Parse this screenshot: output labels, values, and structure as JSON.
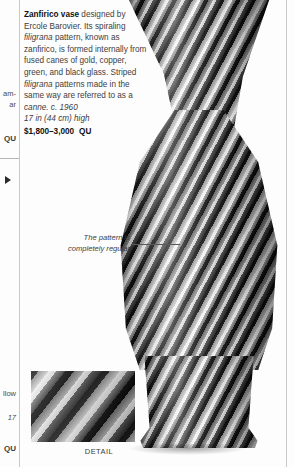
{
  "page": {
    "background": "#fdfdfd",
    "rule_color": "#c9c9c9"
  },
  "caption": {
    "lead_in": "Zanfirico vase",
    "body": " designed by Ercole Barovier. Its spiraling ",
    "italic_1": "filigrana",
    "body_2": " pattern, known as zanfirico, is formed internally from fused canes of gold, copper, green, and black glass. Striped ",
    "italic_2": "filigrana",
    "body_3": " patterns made in the same way are referred to as a ",
    "italic_3": "canne. c. 1960",
    "dimensions": "17 in (44 cm) high",
    "price": "$1,800–3,000",
    "dealer_code": "QU"
  },
  "annotation": {
    "line_1": "The pattern is",
    "line_2": "completely regular"
  },
  "detail": {
    "label": "DETAIL"
  },
  "gutter": {
    "fragment_1": "am-",
    "fragment_2": "ar",
    "code_1": "QU",
    "fragment_3": "llow",
    "fragment_4": "17",
    "code_2": "QU"
  }
}
